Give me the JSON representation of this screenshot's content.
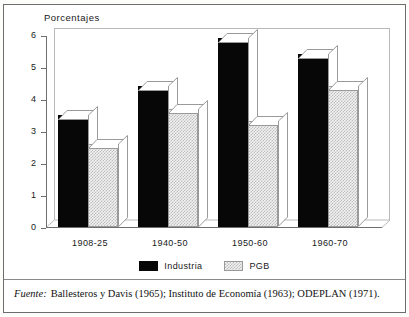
{
  "figure": {
    "axis_title": "Porcentajes",
    "source_label": "Fuente:",
    "source_text": "Ballesteros y Davis (1965); Instituto de Economía (1963); ODEPLAN (1971)."
  },
  "legend": {
    "items": [
      {
        "label": "Industria",
        "color": "#070707",
        "pattern": "solid"
      },
      {
        "label": "PGB",
        "color": "#cfcfcf",
        "pattern": "checker"
      }
    ]
  },
  "chart_data": {
    "type": "bar",
    "title": "Porcentajes",
    "xlabel": "",
    "ylabel": "Porcentajes",
    "ylim": [
      0,
      6
    ],
    "yticks": [
      0,
      1,
      2,
      3,
      4,
      5,
      6
    ],
    "ytick_labels": [
      "0",
      "1",
      "2",
      "3",
      "4",
      "5",
      "6"
    ],
    "grid": false,
    "legend_position": "bottom-center",
    "style": "3d-block",
    "categories": [
      "1908-25",
      "1940-50",
      "1950-60",
      "1960-70"
    ],
    "series": [
      {
        "name": "Industria",
        "color": "#070707",
        "values": [
          3.5,
          4.4,
          5.9,
          5.4
        ]
      },
      {
        "name": "PGB",
        "color": "#cfcfcf",
        "values": [
          2.6,
          3.7,
          3.3,
          4.4
        ]
      }
    ]
  }
}
